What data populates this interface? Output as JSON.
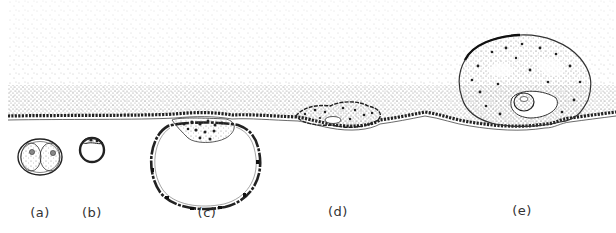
{
  "figure": {
    "type": "diagram",
    "colors": {
      "ink": "#222222",
      "stipple": "#6a6a6a",
      "background": "#ffffff"
    },
    "panels": [
      {
        "id": "a",
        "label": "(a)",
        "x": 40,
        "description": "two-cell embryo"
      },
      {
        "id": "b",
        "label": "(b)",
        "x": 92,
        "description": "small compact embryo"
      },
      {
        "id": "c",
        "label": "(c)",
        "x": 207,
        "description": "blastocyst attaching to epithelium"
      },
      {
        "id": "d",
        "label": "(d)",
        "x": 338,
        "description": "embryo penetrating epithelium"
      },
      {
        "id": "e",
        "label": "(e)",
        "x": 522,
        "description": "embryo embedded in stroma"
      }
    ]
  }
}
